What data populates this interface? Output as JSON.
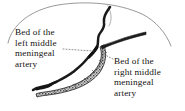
{
  "figure": {
    "background_color": "#ffffff",
    "ink_color": "#15110f",
    "outline_color": "#8d8d8d",
    "groove_fill_color": "#b9b9b9"
  },
  "labels": {
    "left": {
      "name": "left-middle-meningeal-artery-label",
      "lines": [
        "Bed of the",
        "left middle",
        "meningeal",
        "artery"
      ]
    },
    "right": {
      "name": "right-middle-meningeal-artery-label",
      "lines": [
        "Bed of the",
        "right middle",
        "meningeal",
        "artery"
      ]
    }
  },
  "anatomy": {
    "skull_outline": "cranial-vault-outline",
    "left_artery_bed": "dark-sinuous-groove-left",
    "right_artery_bed": "stippled-groove-right",
    "right_artery_branch": "dark-tapered-branch-upper-right",
    "leader_line_left": "dotted-leader-left",
    "leader_line_right": "dotted-leader-right"
  }
}
